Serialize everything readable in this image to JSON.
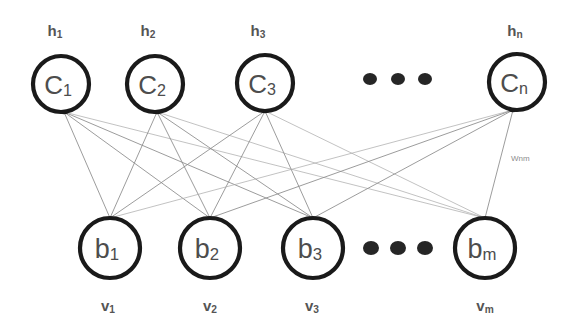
{
  "diagram": {
    "type": "bipartite-neural-network",
    "background_color": "#ffffff",
    "node_stroke_color": "#1a1a1a",
    "node_fill_color": "#ffffff",
    "node_text_color": "#4d4d4d",
    "outside_label_color": "#555555",
    "edge_color": "#8a8a8a",
    "weight_label_color": "#8c8c8c"
  },
  "hidden_layer": {
    "layer_name": "hidden-units",
    "row_label_prefix": "h",
    "nodes": [
      {
        "id": "c1",
        "base": "C",
        "sub": "1",
        "cx": 61,
        "cy": 84,
        "r": 28,
        "top_label_base": "h",
        "top_label_sub": "1",
        "label_x": 55,
        "label_y": 30,
        "anchor_x": 64,
        "anchor_y": 112
      },
      {
        "id": "c2",
        "base": "C",
        "sub": "2",
        "cx": 155,
        "cy": 84,
        "r": 28,
        "top_label_base": "h",
        "top_label_sub": "2",
        "label_x": 148,
        "label_y": 30,
        "anchor_x": 157,
        "anchor_y": 112
      },
      {
        "id": "c3",
        "base": "C",
        "sub": "3",
        "cx": 265,
        "cy": 83,
        "r": 28,
        "top_label_base": "h",
        "top_label_sub": "3",
        "label_x": 258,
        "label_y": 30,
        "anchor_x": 265,
        "anchor_y": 111
      },
      {
        "id": "cn",
        "base": "C",
        "sub": "n",
        "cx": 517,
        "cy": 82,
        "r": 28,
        "top_label_base": "h",
        "top_label_sub": "n",
        "label_x": 515,
        "label_y": 30,
        "anchor_x": 513,
        "anchor_y": 110
      }
    ],
    "ellipsis": {
      "name": "hidden-layer-ellipsis",
      "dots": [
        {
          "cx": 370,
          "cy": 79,
          "r": 6
        },
        {
          "cx": 398,
          "cy": 79,
          "r": 6
        },
        {
          "cx": 425,
          "cy": 79,
          "r": 6
        }
      ]
    }
  },
  "visible_layer": {
    "layer_name": "visible-units",
    "row_label_prefix": "v",
    "nodes": [
      {
        "id": "b1",
        "base": "b",
        "sub": "1",
        "cx": 110,
        "cy": 248,
        "r": 30,
        "bottom_label_base": "v",
        "bottom_label_sub": "1",
        "label_x": 108,
        "label_y": 305,
        "anchor_x": 110,
        "anchor_y": 218
      },
      {
        "id": "b2",
        "base": "b",
        "sub": "2",
        "cx": 210,
        "cy": 248,
        "r": 30,
        "bottom_label_base": "v",
        "bottom_label_sub": "2",
        "label_x": 210,
        "label_y": 305,
        "anchor_x": 210,
        "anchor_y": 218
      },
      {
        "id": "b3",
        "base": "b",
        "sub": "3",
        "cx": 313,
        "cy": 248,
        "r": 30,
        "bottom_label_base": "v",
        "bottom_label_sub": "3",
        "label_x": 312,
        "label_y": 305,
        "anchor_x": 313,
        "anchor_y": 218
      },
      {
        "id": "bm",
        "base": "b",
        "sub": "m",
        "cx": 485,
        "cy": 248,
        "r": 30,
        "bottom_label_base": "v",
        "bottom_label_sub": "m",
        "label_x": 485,
        "label_y": 305,
        "anchor_x": 485,
        "anchor_y": 218
      }
    ],
    "ellipsis": {
      "name": "visible-layer-ellipsis",
      "dots": [
        {
          "cx": 371,
          "cy": 248,
          "r": 7
        },
        {
          "cx": 398,
          "cy": 248,
          "r": 7
        },
        {
          "cx": 425,
          "cy": 248,
          "r": 7
        }
      ]
    }
  },
  "weight_label": {
    "name": "weight-wnm",
    "text": "Wnm",
    "x": 511,
    "y": 158
  },
  "connections": {
    "description": "fully connected bipartite edges from every hidden node to every visible node",
    "pairs": [
      [
        "c1",
        "b1"
      ],
      [
        "c1",
        "b2"
      ],
      [
        "c1",
        "b3"
      ],
      [
        "c1",
        "bm"
      ],
      [
        "c2",
        "b1"
      ],
      [
        "c2",
        "b2"
      ],
      [
        "c2",
        "b3"
      ],
      [
        "c2",
        "bm"
      ],
      [
        "c3",
        "b1"
      ],
      [
        "c3",
        "b2"
      ],
      [
        "c3",
        "b3"
      ],
      [
        "c3",
        "bm"
      ],
      [
        "cn",
        "b1"
      ],
      [
        "cn",
        "b2"
      ],
      [
        "cn",
        "b3"
      ],
      [
        "cn",
        "bm"
      ]
    ],
    "faint_pairs": [
      [
        "c1",
        "bm"
      ],
      [
        "c2",
        "bm"
      ],
      [
        "c3",
        "bm"
      ],
      [
        "cn",
        "b1"
      ]
    ]
  }
}
